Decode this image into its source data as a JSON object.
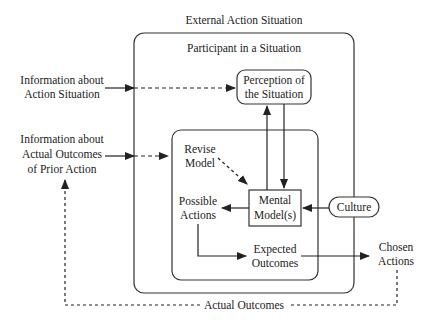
{
  "diagram": {
    "outer_box_label": "External Action Situation",
    "participant_box_label": "Participant in a Situation",
    "perception": [
      "Perception of",
      "the Situation"
    ],
    "info_action_situation": [
      "Information about",
      "Action Situation"
    ],
    "info_outcomes": [
      "Information about",
      "Actual Outcomes",
      "of Prior Action"
    ],
    "revise_model": [
      "Revise",
      "Model"
    ],
    "possible_actions": [
      "Possible",
      "Actions"
    ],
    "mental_models": [
      "Mental",
      "Model(s)"
    ],
    "culture": "Culture",
    "expected_outcomes": [
      "Expected",
      "Outcomes"
    ],
    "chosen_actions": [
      "Chosen",
      "Actions"
    ],
    "actual_outcomes": "Actual Outcomes"
  },
  "colors": {
    "stroke": "#333333",
    "text": "#222222",
    "background": "#ffffff"
  }
}
